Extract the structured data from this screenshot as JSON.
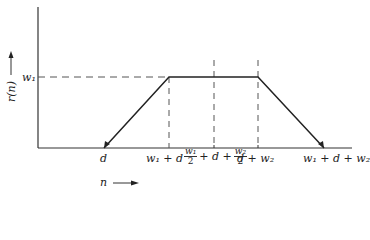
{
  "diagram": {
    "type": "piecewise-linear trapezoid plot",
    "y_axis": {
      "label": "r(n)",
      "arrow": "up"
    },
    "x_axis": {
      "label": "n",
      "arrow": "right"
    },
    "level_label": "w₁",
    "x_ticks": [
      {
        "id": "d",
        "label": "d"
      },
      {
        "id": "w1_d",
        "label": "w₁ + d"
      },
      {
        "id": "mid",
        "num1": "w₁",
        "den1": "2",
        "mid_text": "+ d +",
        "num2": "w₂",
        "den2": "2"
      },
      {
        "id": "d_w2",
        "label": "d + w₂"
      },
      {
        "id": "w1_d_w2",
        "label": "w₁ + d + w₂"
      }
    ],
    "curve_points": [
      {
        "x": "d",
        "y": 0
      },
      {
        "x": "w₁ + d",
        "y": "w₁"
      },
      {
        "x": "d + w₂",
        "y": "w₁"
      },
      {
        "x": "w₁ + d + w₂",
        "y": 0
      }
    ],
    "colors": {
      "line": "#222222",
      "dash": "#555555",
      "background": "#ffffff"
    }
  }
}
